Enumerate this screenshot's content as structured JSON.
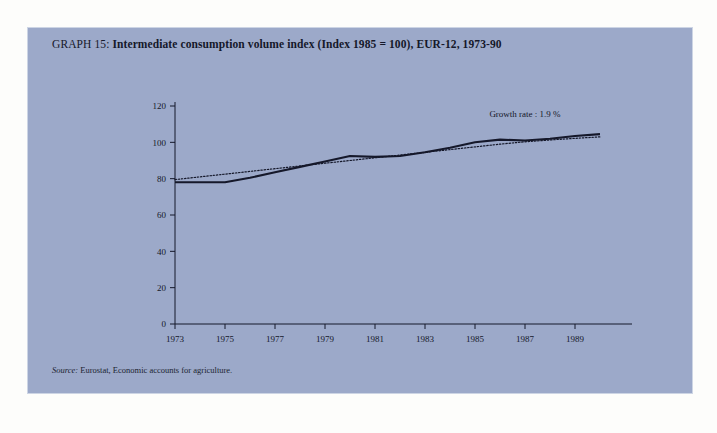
{
  "figure": {
    "title_lead": "GRAPH 15:",
    "title_main": " Intermediate consumption volume index (Index 1985 = 100), EUR-12, 1973-90",
    "source_label": "Source:",
    "source_text": " Eurostat, Economic accounts for agriculture.",
    "panel_color": "#9ca9c9",
    "page_color": "#fdfdfb",
    "ink_color": "#15182a"
  },
  "chart_data": {
    "type": "line",
    "title": "GRAPH 15: Intermediate consumption volume index (Index 1985 = 100), EUR-12, 1973-90",
    "xlabel": "",
    "ylabel": "",
    "xlim": [
      1973,
      1990
    ],
    "ylim": [
      0,
      120
    ],
    "yticks": [
      0,
      20,
      40,
      60,
      80,
      100,
      120
    ],
    "xticks": [
      1973,
      1975,
      1977,
      1979,
      1981,
      1983,
      1985,
      1987,
      1989
    ],
    "xtick_labels": [
      "1973",
      "1975",
      "1977",
      "1979",
      "1981",
      "1983",
      "1985",
      "1987",
      "1989"
    ],
    "ytick_labels": [
      "0",
      "20",
      "40",
      "60",
      "80",
      "100",
      "120"
    ],
    "grid": false,
    "legend": "none",
    "x": [
      1973,
      1974,
      1975,
      1976,
      1977,
      1978,
      1979,
      1980,
      1981,
      1982,
      1983,
      1984,
      1985,
      1986,
      1987,
      1988,
      1989,
      1990
    ],
    "series": [
      {
        "name": "Intermediate consumption volume index",
        "style": "solid",
        "values": [
          78.0,
          78.0,
          78.0,
          80.5,
          83.5,
          86.5,
          89.5,
          92.5,
          92.0,
          92.5,
          94.5,
          97.0,
          100.0,
          101.5,
          101.0,
          102.0,
          103.5,
          104.5
        ]
      },
      {
        "name": "Trend (growth rate 1.9 %)",
        "style": "dotted",
        "values": [
          79.5,
          81.0,
          82.5,
          84.0,
          85.5,
          87.0,
          88.5,
          90.0,
          91.5,
          93.0,
          94.5,
          96.0,
          97.5,
          99.0,
          100.3,
          101.3,
          102.2,
          103.0
        ]
      }
    ],
    "annotations": [
      {
        "name": "growth-rate-label",
        "text": "Growth rate : 1.9 %",
        "x": 1987.0,
        "y": 114
      }
    ]
  }
}
